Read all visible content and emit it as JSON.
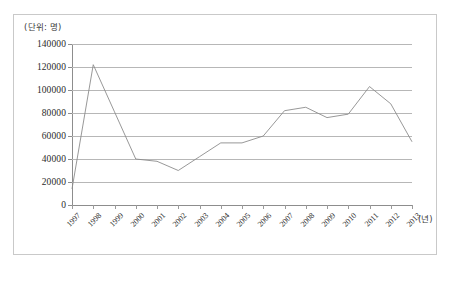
{
  "figure": {
    "unit_label": "(단위: 명)",
    "xaxis_title": "(년)",
    "caption": ""
  },
  "chart_data": {
    "type": "line",
    "title": "",
    "subtitle": "",
    "xlabel": "(년)",
    "ylabel": "(단위: 명)",
    "categories": [
      "1997",
      "1998",
      "1999",
      "2000",
      "2001",
      "2002",
      "2003",
      "2004",
      "2005",
      "2006",
      "2007",
      "2008",
      "2009",
      "2010",
      "2011",
      "2012",
      "2013"
    ],
    "values": [
      14000,
      122000,
      81000,
      40000,
      38000,
      30000,
      42000,
      54000,
      54000,
      60000,
      82000,
      85000,
      76000,
      79000,
      103000,
      88000,
      55000
    ],
    "series": [
      {
        "name": "",
        "values": [
          14000,
          122000,
          81000,
          40000,
          38000,
          30000,
          42000,
          54000,
          54000,
          60000,
          82000,
          85000,
          76000,
          79000,
          103000,
          88000,
          55000
        ]
      }
    ],
    "ylim": [
      0,
      140000
    ],
    "yticks": [
      0,
      20000,
      40000,
      60000,
      80000,
      100000,
      120000,
      140000
    ],
    "ytick_labels": [
      "0",
      "20000",
      "40000",
      "60000",
      "80000",
      "100000",
      "120000",
      "140000"
    ],
    "grid": true,
    "legend": false,
    "legend_position": "none",
    "line_color": "#8c8c8c",
    "grid_color": "#b7b7b7",
    "axis_color": "#8d8d8d",
    "markers": false
  }
}
